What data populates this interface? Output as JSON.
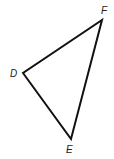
{
  "diagram": {
    "type": "triangle",
    "vertices": [
      {
        "name": "D",
        "label": "D"
      },
      {
        "name": "E",
        "label": "E"
      },
      {
        "name": "F",
        "label": "F"
      }
    ],
    "sides": [
      "DE",
      "EF",
      "FD"
    ],
    "stroke_color": "#111111",
    "label_color": "#222222"
  }
}
